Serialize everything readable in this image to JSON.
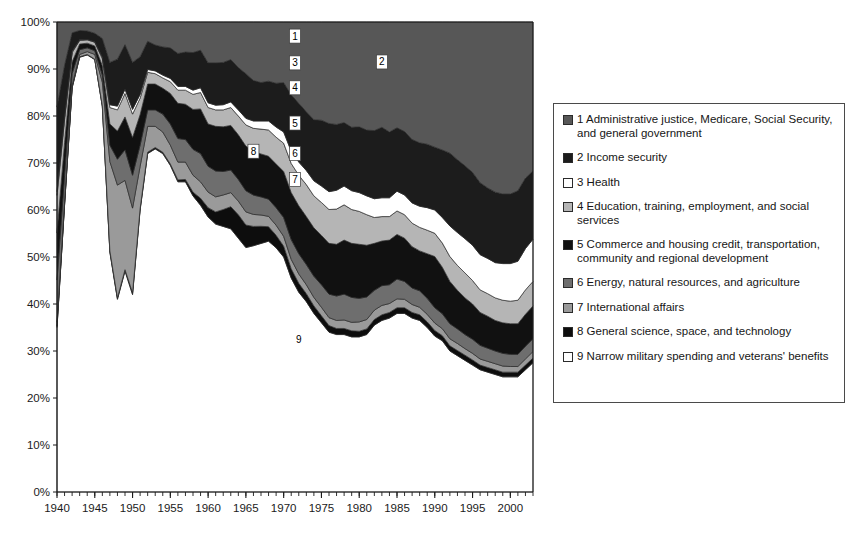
{
  "chart_data": {
    "type": "area",
    "stacked": true,
    "normalized": true,
    "title": "",
    "subtitle": "",
    "xlabel": "",
    "ylabel": "",
    "xlim": [
      1940,
      2003
    ],
    "ylim": [
      0,
      100
    ],
    "grid": false,
    "legend_position": "right",
    "y_tick_labels": [
      "0%",
      "10%",
      "20%",
      "30%",
      "40%",
      "50%",
      "60%",
      "70%",
      "80%",
      "90%",
      "100%"
    ],
    "y_tick_values": [
      0,
      10,
      20,
      30,
      40,
      50,
      60,
      70,
      80,
      90,
      100
    ],
    "x_tick_labels": [
      "1940",
      "1945",
      "1950",
      "1955",
      "1960",
      "1965",
      "1970",
      "1975",
      "1980",
      "1985",
      "1990",
      "1995",
      "2000"
    ],
    "x_tick_values": [
      1940,
      1945,
      1950,
      1955,
      1960,
      1965,
      1970,
      1975,
      1980,
      1985,
      1990,
      1995,
      2000
    ],
    "x_minor_tick_step": 1,
    "years": [
      1940,
      1941,
      1942,
      1943,
      1944,
      1945,
      1946,
      1947,
      1948,
      1949,
      1950,
      1951,
      1952,
      1953,
      1954,
      1955,
      1956,
      1957,
      1958,
      1959,
      1960,
      1961,
      1962,
      1963,
      1964,
      1965,
      1966,
      1967,
      1968,
      1969,
      1970,
      1971,
      1972,
      1973,
      1974,
      1975,
      1976,
      1977,
      1978,
      1979,
      1980,
      1981,
      1982,
      1983,
      1984,
      1985,
      1986,
      1987,
      1988,
      1989,
      1990,
      1991,
      1992,
      1993,
      1994,
      1995,
      1996,
      1997,
      1998,
      1999,
      2000,
      2001,
      2002,
      2003
    ],
    "series": [
      {
        "name": "9 Narrow military spending and veterans' benefits",
        "key": "military_veterans",
        "number": "9",
        "color": "#ffffff",
        "values": [
          35.0,
          61.0,
          86.0,
          92.5,
          93.0,
          92.0,
          82.0,
          51.0,
          41.0,
          47.0,
          42.0,
          60.0,
          72.0,
          73.0,
          72.0,
          69.5,
          66.0,
          66.0,
          63.0,
          61.0,
          58.5,
          57.0,
          56.5,
          56.0,
          54.0,
          52.0,
          53.5,
          55.0,
          55.5,
          53.0,
          50.0,
          45.5,
          42.5,
          40.5,
          38.0,
          36.0,
          34.0,
          33.5,
          33.5,
          33.0,
          33.0,
          33.5,
          35.5,
          36.5,
          37.0,
          38.0,
          38.0,
          37.0,
          36.5,
          35.0,
          33.5,
          32.5,
          30.0,
          29.0,
          28.0,
          27.0,
          26.0,
          25.5,
          25.0,
          24.5,
          24.5,
          24.5,
          26.0,
          27.5
        ]
      },
      {
        "name": "8 General science, space, and technology",
        "key": "science_space",
        "number": "8",
        "color": "#0d0d0d",
        "values": [
          0.3,
          0.2,
          0.1,
          0.1,
          0.1,
          0.1,
          0.2,
          0.3,
          0.3,
          0.3,
          0.4,
          0.3,
          0.3,
          0.3,
          0.3,
          0.3,
          0.4,
          0.5,
          0.8,
          1.5,
          2.0,
          2.6,
          3.6,
          4.7,
          5.0,
          4.8,
          4.2,
          3.8,
          3.2,
          2.7,
          2.3,
          2.0,
          1.9,
          1.7,
          1.6,
          1.5,
          1.4,
          1.3,
          1.3,
          1.3,
          1.2,
          1.2,
          1.2,
          1.2,
          1.2,
          1.2,
          1.2,
          1.2,
          1.2,
          1.2,
          1.2,
          1.1,
          1.1,
          1.1,
          1.1,
          1.1,
          1.0,
          1.0,
          1.0,
          1.0,
          1.0,
          1.0,
          1.0,
          1.0
        ]
      },
      {
        "name": "7 International affairs",
        "key": "international_affairs",
        "number": "7",
        "color": "#9a9a9a",
        "values": [
          0.8,
          0.6,
          0.4,
          0.5,
          0.6,
          1.0,
          5.0,
          19.0,
          24.0,
          19.0,
          18.0,
          9.0,
          5.5,
          4.5,
          4.3,
          4.0,
          3.8,
          3.7,
          3.6,
          3.5,
          3.3,
          3.2,
          3.1,
          3.0,
          2.9,
          2.8,
          2.6,
          2.5,
          2.3,
          2.2,
          2.1,
          2.0,
          2.0,
          1.9,
          1.8,
          1.8,
          1.7,
          1.7,
          1.8,
          1.8,
          2.0,
          2.0,
          2.0,
          2.0,
          1.9,
          1.9,
          1.8,
          1.7,
          1.6,
          1.6,
          1.6,
          1.5,
          1.5,
          1.5,
          1.4,
          1.4,
          1.3,
          1.3,
          1.3,
          1.3,
          1.2,
          1.2,
          1.3,
          1.4
        ]
      },
      {
        "name": "6 Energy, natural resources,  and agriculture",
        "key": "energy_resources_agriculture",
        "number": "6",
        "color": "#6e6e6e",
        "values": [
          9.0,
          5.5,
          2.5,
          1.0,
          0.8,
          0.8,
          1.5,
          3.5,
          5.5,
          6.5,
          7.0,
          4.5,
          3.5,
          3.5,
          3.8,
          4.5,
          5.0,
          4.8,
          5.5,
          6.0,
          5.5,
          5.5,
          5.0,
          4.8,
          4.6,
          4.5,
          4.2,
          4.0,
          3.8,
          3.8,
          4.0,
          4.2,
          4.3,
          4.3,
          4.5,
          4.8,
          5.0,
          5.2,
          5.5,
          5.3,
          5.0,
          4.8,
          4.2,
          4.2,
          4.0,
          4.2,
          3.8,
          3.5,
          3.5,
          3.4,
          3.3,
          3.2,
          3.2,
          3.1,
          3.0,
          3.0,
          2.9,
          2.8,
          2.7,
          2.7,
          2.6,
          2.6,
          2.7,
          2.7
        ]
      },
      {
        "name": "5 Commerce and housing credit, transportation, community and regional development",
        "key": "commerce_transportation",
        "number": "5",
        "color": "#111111",
        "values": [
          10.0,
          7.0,
          2.5,
          1.2,
          1.0,
          1.0,
          2.0,
          4.5,
          6.0,
          7.0,
          8.0,
          6.5,
          5.5,
          5.5,
          5.5,
          6.5,
          7.5,
          7.5,
          8.5,
          9.5,
          9.0,
          9.5,
          9.5,
          9.5,
          9.5,
          9.5,
          9.5,
          9.5,
          9.5,
          9.5,
          9.8,
          10.0,
          10.2,
          10.2,
          10.3,
          10.5,
          10.8,
          11.0,
          11.5,
          11.5,
          11.5,
          11.0,
          10.0,
          9.5,
          9.5,
          9.5,
          9.2,
          8.8,
          8.5,
          9.5,
          11.0,
          10.0,
          9.0,
          8.2,
          7.8,
          7.5,
          7.0,
          6.8,
          6.5,
          6.5,
          6.5,
          6.5,
          6.8,
          7.0
        ]
      },
      {
        "name": "4 Education, training, employment, and social services",
        "key": "education_training",
        "number": "4",
        "color": "#b5b5b5",
        "values": [
          8.0,
          5.0,
          2.0,
          0.8,
          0.7,
          0.8,
          1.5,
          3.5,
          4.5,
          5.0,
          5.0,
          3.5,
          2.5,
          2.2,
          2.2,
          2.5,
          2.8,
          3.0,
          3.2,
          3.5,
          3.5,
          3.5,
          3.6,
          3.8,
          4.0,
          4.5,
          5.0,
          5.5,
          5.8,
          5.8,
          6.0,
          6.2,
          6.5,
          6.8,
          6.8,
          7.0,
          7.2,
          7.5,
          7.5,
          7.2,
          7.0,
          6.5,
          5.5,
          5.2,
          5.0,
          5.0,
          5.0,
          5.0,
          5.0,
          5.0,
          5.0,
          5.2,
          5.3,
          5.3,
          5.3,
          5.0,
          4.8,
          4.8,
          4.8,
          4.8,
          4.8,
          5.0,
          5.2,
          5.2
        ]
      },
      {
        "name": "3 Health",
        "key": "health",
        "number": "3",
        "color": "#ffffff",
        "values": [
          0.8,
          0.5,
          0.2,
          0.1,
          0.1,
          0.1,
          0.3,
          0.6,
          0.8,
          0.9,
          1.0,
          0.8,
          0.6,
          0.6,
          0.6,
          0.7,
          0.8,
          0.8,
          0.9,
          1.0,
          1.0,
          1.0,
          1.1,
          1.2,
          1.3,
          1.4,
          1.6,
          1.8,
          2.0,
          2.2,
          2.4,
          2.6,
          2.8,
          3.0,
          3.2,
          3.5,
          3.8,
          4.0,
          4.0,
          4.0,
          4.0,
          4.0,
          4.0,
          4.0,
          4.0,
          4.2,
          4.2,
          4.3,
          4.5,
          4.8,
          5.0,
          5.5,
          6.5,
          7.0,
          7.3,
          7.5,
          7.5,
          7.5,
          7.5,
          7.8,
          8.0,
          8.3,
          8.8,
          9.0
        ]
      },
      {
        "name": "2 Income security",
        "key": "income_security",
        "number": "2",
        "color": "#1c1c1c",
        "values": [
          18.0,
          11.0,
          4.0,
          2.0,
          1.8,
          1.8,
          4.0,
          9.0,
          10.0,
          9.5,
          10.0,
          8.0,
          6.0,
          5.5,
          6.0,
          6.5,
          7.0,
          7.3,
          8.0,
          8.0,
          8.5,
          9.0,
          9.0,
          9.0,
          9.0,
          9.5,
          8.8,
          8.5,
          8.8,
          9.5,
          10.5,
          12.0,
          12.5,
          12.5,
          13.0,
          14.0,
          14.5,
          14.0,
          13.5,
          13.5,
          14.0,
          14.0,
          14.5,
          15.0,
          14.0,
          13.5,
          13.5,
          13.5,
          13.5,
          13.5,
          13.5,
          14.5,
          15.5,
          15.5,
          15.5,
          15.5,
          15.3,
          15.0,
          15.0,
          14.8,
          14.8,
          15.0,
          15.0,
          14.5
        ]
      },
      {
        "name": "1 Administrative justice, Medicare, Social Security, and general government",
        "key": "admin_medicare_socsec",
        "number": "1",
        "color": "#575757",
        "values": [
          18.1,
          9.2,
          2.3,
          1.8,
          1.9,
          2.4,
          3.5,
          8.6,
          7.9,
          4.8,
          8.6,
          7.4,
          4.1,
          4.9,
          5.3,
          5.5,
          6.7,
          6.4,
          6.5,
          6.0,
          8.7,
          8.7,
          8.6,
          8.0,
          9.7,
          11.0,
          12.7,
          13.4,
          13.1,
          13.3,
          12.9,
          15.5,
          17.3,
          19.1,
          20.8,
          20.9,
          21.6,
          21.8,
          21.4,
          22.4,
          22.3,
          23.0,
          23.1,
          22.4,
          23.4,
          22.5,
          23.3,
          25.0,
          25.7,
          26.0,
          26.9,
          27.5,
          27.9,
          29.3,
          30.6,
          32.0,
          34.2,
          35.3,
          36.2,
          36.6,
          36.6,
          35.9,
          33.2,
          31.7
        ]
      }
    ],
    "band_labels": [
      {
        "number": "1",
        "x_year": 1971.5,
        "y_pct": 97.0,
        "boxed": true
      },
      {
        "number": "2",
        "x_year": 1983.0,
        "y_pct": 91.5,
        "boxed": true
      },
      {
        "number": "3",
        "x_year": 1971.5,
        "y_pct": 91.3,
        "boxed": true
      },
      {
        "number": "4",
        "x_year": 1971.5,
        "y_pct": 86.0,
        "boxed": true
      },
      {
        "number": "5",
        "x_year": 1971.5,
        "y_pct": 78.5,
        "boxed": true
      },
      {
        "number": "6",
        "x_year": 1971.5,
        "y_pct": 72.0,
        "boxed": true
      },
      {
        "number": "7",
        "x_year": 1971.5,
        "y_pct": 66.5,
        "boxed": true
      },
      {
        "number": "8",
        "x_year": 1966.0,
        "y_pct": 72.5,
        "boxed": true
      },
      {
        "number": "9",
        "x_year": 1972.0,
        "y_pct": 32.5,
        "boxed": false
      }
    ]
  },
  "legend": {
    "items": [
      {
        "number": "1",
        "label": "1 Administrative justice, Medicare, Social Security, and general government",
        "color": "#575757"
      },
      {
        "number": "2",
        "label": "2 Income security",
        "color": "#1c1c1c"
      },
      {
        "number": "3",
        "label": "3 Health",
        "color": "#ffffff"
      },
      {
        "number": "4",
        "label": "4 Education, training, employment, and social services",
        "color": "#b5b5b5"
      },
      {
        "number": "5",
        "label": "5 Commerce and housing credit, transportation, community and regional development",
        "color": "#111111"
      },
      {
        "number": "6",
        "label": "6 Energy, natural resources,  and agriculture",
        "color": "#6e6e6e"
      },
      {
        "number": "7",
        "label": "7 International affairs",
        "color": "#9a9a9a"
      },
      {
        "number": "8",
        "label": "8 General science, space, and technology",
        "color": "#0d0d0d"
      },
      {
        "number": "9",
        "label": "9 Narrow military spending and veterans' benefits",
        "color": "#ffffff"
      }
    ]
  },
  "colors": {
    "axis": "#1b1b1b",
    "plot_border": "#1b1b1b",
    "background": "#ffffff",
    "legend_border": "#4a4a4a"
  }
}
